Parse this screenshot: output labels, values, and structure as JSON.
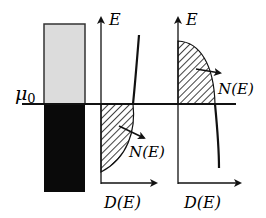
{
  "diagram": {
    "labels": {
      "mu0": "μ",
      "mu0_sub": "0",
      "e_axis_mid": "E",
      "e_axis_right": "E",
      "n_mid": "N(E)",
      "n_right": "N(E)",
      "d_mid": "D(E)",
      "d_right": "D(E)"
    },
    "colors": {
      "line": "#111111",
      "upper_block": "#dcdcdc",
      "lower_block": "#0a0a0a",
      "background": "#ffffff"
    },
    "panels": [
      {
        "name": "energy-block",
        "description": "Rectangle split at chemical potential: light upper part, filled lower part"
      },
      {
        "name": "dos-filled-below",
        "description": "Density of states with hatched occupied region below μ0, N(E) arrow"
      },
      {
        "name": "dos-filled-above",
        "description": "Density of states with hatched region above μ0, N(E) arrow"
      }
    ]
  }
}
